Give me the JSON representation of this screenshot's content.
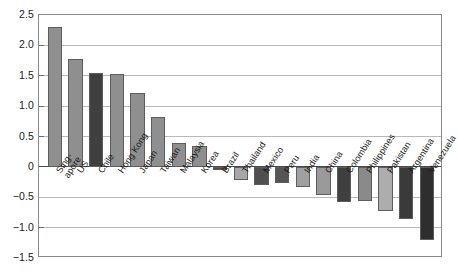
{
  "chart_data": {
    "type": "bar",
    "title": "",
    "subtitle": "",
    "xlabel": "",
    "ylabel": "",
    "ylim": [
      -1.5,
      2.5
    ],
    "ytick_labels": [
      "2.5",
      "2.0",
      "1.5",
      "1.0",
      "0.5",
      "0",
      "-0.5",
      "-1.0",
      "-1.5"
    ],
    "ytick_values": [
      2.5,
      2.0,
      1.5,
      1.0,
      0.5,
      0,
      -0.5,
      -1.0,
      -1.5
    ],
    "grid": true,
    "grid_axis": "y",
    "legend": null,
    "legend_position": "none",
    "categories": [
      "Singapore",
      "US",
      "Chile",
      "Hong Kong",
      "Japan",
      "Taiwan",
      "Malaysia",
      "Korea",
      "Brazil",
      "Thailand",
      "Mexico",
      "Peru",
      "India",
      "China",
      "Colombia",
      "Philippines",
      "Pakistan",
      "Argentina",
      "Venezuela"
    ],
    "category_display": [
      "Sing-\napore",
      "US",
      "Chile",
      "Hong Kong",
      "Japan",
      "Taiwan",
      "Malaysia",
      "Korea",
      "Brazil",
      "Thailand",
      "Mexico",
      "Peru",
      "India",
      "China",
      "Colombia",
      "Philippines",
      "Pakistan",
      "Argentina",
      "Venezuela"
    ],
    "values": [
      2.3,
      1.77,
      1.55,
      1.53,
      1.21,
      0.82,
      0.4,
      0.35,
      -0.05,
      -0.22,
      -0.3,
      -0.27,
      -0.33,
      -0.47,
      -0.57,
      -0.56,
      -0.73,
      -0.85,
      -1.2
    ],
    "bar_colors": [
      "#8f8f8f",
      "#8f8f8f",
      "#3f3f3f",
      "#8f8f8f",
      "#8f8f8f",
      "#8f8f8f",
      "#8f8f8f",
      "#8f8f8f",
      "#4a4a4a",
      "#a8a8a8",
      "#4f4f4f",
      "#555555",
      "#a0a0a0",
      "#9a9a9a",
      "#3f3f3f",
      "#8a8a8a",
      "#adadad",
      "#3a3a3a",
      "#2e2e2e"
    ],
    "bar_edge_color": "#5d5d5d",
    "axis_color": "#8a8a8a",
    "gridline_color": "#b9b9b9",
    "zeroline_color": "#4a4a4a",
    "background_color": "#ffffff",
    "text_color": "#1a1a1a"
  }
}
